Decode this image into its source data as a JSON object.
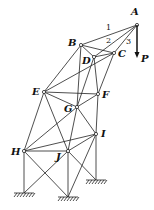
{
  "diagram": {
    "nodes": [
      {
        "id": "A",
        "x": 137,
        "y": 25,
        "lx": 131,
        "ly": 15
      },
      {
        "id": "B",
        "x": 81,
        "y": 45,
        "lx": 68,
        "ly": 46
      },
      {
        "id": "C",
        "x": 114,
        "y": 53,
        "lx": 118,
        "ly": 57
      },
      {
        "id": "D",
        "x": 94,
        "y": 57,
        "lx": 82,
        "ly": 64
      },
      {
        "id": "E",
        "x": 44,
        "y": 92,
        "lx": 32,
        "ly": 95
      },
      {
        "id": "F",
        "x": 98,
        "y": 94,
        "lx": 102,
        "ly": 98
      },
      {
        "id": "G",
        "x": 77,
        "y": 107,
        "lx": 64,
        "ly": 112
      },
      {
        "id": "H",
        "x": 24,
        "y": 151,
        "lx": 11,
        "ly": 155
      },
      {
        "id": "I",
        "x": 96,
        "y": 134,
        "lx": 101,
        "ly": 137
      },
      {
        "id": "J",
        "x": 68,
        "y": 151,
        "lx": 56,
        "ly": 160
      }
    ],
    "supports": [
      {
        "id": "H0",
        "x": 24,
        "y": 193
      },
      {
        "id": "J0",
        "x": 68,
        "y": 197
      },
      {
        "id": "I0",
        "x": 96,
        "y": 180
      }
    ],
    "members": [
      [
        "A",
        "B"
      ],
      [
        "A",
        "D"
      ],
      [
        "A",
        "C"
      ],
      [
        "B",
        "C"
      ],
      [
        "B",
        "D"
      ],
      [
        "D",
        "C"
      ],
      [
        "B",
        "E"
      ],
      [
        "B",
        "G"
      ],
      [
        "E",
        "C"
      ],
      [
        "D",
        "G"
      ],
      [
        "D",
        "F"
      ],
      [
        "C",
        "F"
      ],
      [
        "E",
        "F"
      ],
      [
        "E",
        "G"
      ],
      [
        "G",
        "F"
      ],
      [
        "E",
        "H"
      ],
      [
        "E",
        "J"
      ],
      [
        "G",
        "H"
      ],
      [
        "G",
        "I"
      ],
      [
        "G",
        "J"
      ],
      [
        "F",
        "I"
      ],
      [
        "H",
        "I"
      ],
      [
        "H",
        "J"
      ],
      [
        "J",
        "I"
      ],
      [
        "H",
        "H0"
      ],
      [
        "J",
        "J0"
      ],
      [
        "I",
        "I0"
      ],
      [
        "H",
        "J0"
      ],
      [
        "J",
        "H0"
      ],
      [
        "J",
        "I0"
      ],
      [
        "I",
        "J0"
      ]
    ],
    "member_labels": [
      {
        "text": "1",
        "x": 106,
        "y": 30
      },
      {
        "text": "2",
        "x": 106,
        "y": 43
      },
      {
        "text": "3",
        "x": 126,
        "y": 44
      }
    ],
    "load": {
      "label": "P",
      "x1": 137,
      "y1": 25,
      "x2": 137,
      "y2": 58,
      "lx": 141,
      "ly": 62
    }
  }
}
